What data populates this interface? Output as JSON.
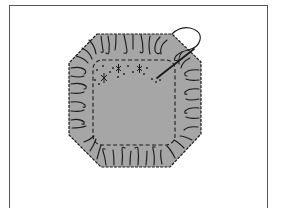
{
  "figure": {
    "colors": {
      "background": "#ffffff",
      "frame": "#555555",
      "fabric": "#a6a6a6",
      "ink": "#1a1a1a"
    },
    "elements": [
      "frame",
      "octagon-fabric",
      "gather-folds",
      "dashed-stitch-line",
      "cross-stitch-marks",
      "needle",
      "thread-loop"
    ]
  }
}
